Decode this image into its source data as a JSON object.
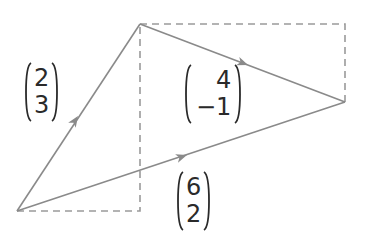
{
  "diagram": {
    "colors": {
      "line": "#8a8a8a",
      "dashed": "#9a9a9a",
      "text": "#2a2a2a"
    },
    "points": {
      "origin": [
        17,
        211
      ],
      "top": [
        140,
        24
      ],
      "right": [
        345,
        102
      ],
      "corner_bottom": [
        140,
        211
      ],
      "corner_top_right": [
        345,
        24
      ]
    },
    "vectors": [
      {
        "id": "a",
        "top": "2",
        "bottom": "3"
      },
      {
        "id": "b",
        "top": "4",
        "bottom": "−1"
      },
      {
        "id": "sum",
        "top": "6",
        "bottom": "2"
      }
    ]
  }
}
